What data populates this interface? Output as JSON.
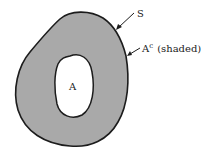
{
  "diagram": {
    "set_S_label": "S",
    "complement_label_base": "A",
    "complement_label_sup": "c",
    "complement_label_suffix": "(shaded)",
    "set_A_label": "A",
    "colors": {
      "shaded_region": "#a9a9a9",
      "outline": "#1c1c1c",
      "hole": "#ffffff",
      "background": "#ffffff"
    }
  }
}
